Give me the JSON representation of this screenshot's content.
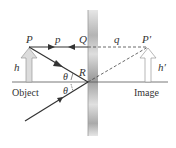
{
  "diagram": {
    "labels": {
      "object_point": "P",
      "image_point": "P′",
      "mirror_top_point": "Q",
      "mirror_reflection_point": "R",
      "object_distance": "p",
      "image_distance": "q",
      "object_height": "h",
      "image_height": "h′",
      "incidence_angle": "θ",
      "reflection_angle": "θ",
      "object_caption": "Object",
      "image_caption": "Image"
    },
    "colors": {
      "ray": "#333333",
      "dashed": "#444444",
      "arrow_fill": "#dcdcdc",
      "arrow_stroke": "#888888",
      "mirror_dark": "#9a9a9a",
      "mirror_light": "#e4e4e4"
    }
  }
}
